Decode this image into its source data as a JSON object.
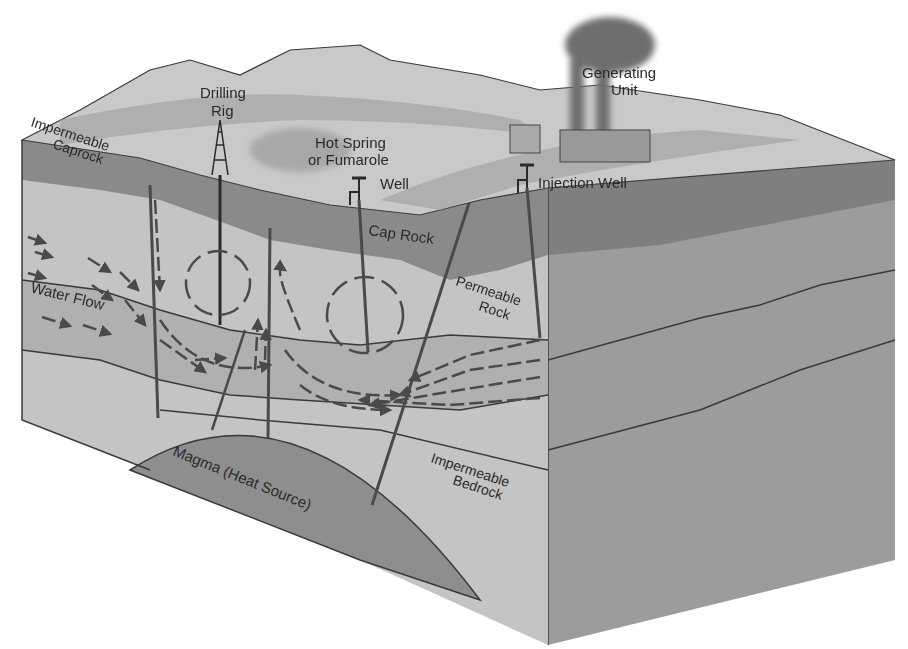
{
  "diagram": {
    "colors": {
      "background": "#ffffff",
      "surface_light": "#c9c9c9",
      "surface_band": "#a9a9a9",
      "caprock": "#8a8a8a",
      "permeable_rock": "#bdbdbd",
      "aquifer_band": "#b0b0b0",
      "bedrock": "#c4c4c4",
      "side_face": "#9c9c9c",
      "side_face_dark": "#7f7f7f",
      "magma": "#8e8e8e",
      "lines": "#3a3a3a",
      "arrows": "#4a4a4a",
      "smoke": "#6e6e6e"
    },
    "labels": {
      "drilling_rig": [
        "Drilling",
        "Rig"
      ],
      "generating_unit": [
        "Generating",
        "Unit"
      ],
      "impermeable_caprock": [
        "Impermeable",
        "Caprock"
      ],
      "hot_spring": [
        "Hot Spring",
        "or Fumarole"
      ],
      "well": "Well",
      "injection_well": "Injection Well",
      "cap_rock": "Cap Rock",
      "water_flow": "Water Flow",
      "permeable_rock": [
        "Permeable",
        "Rock"
      ],
      "magma": "Magma (Heat Source)",
      "impermeable_bedrock": [
        "Impermeable",
        "Bedrock"
      ]
    }
  }
}
